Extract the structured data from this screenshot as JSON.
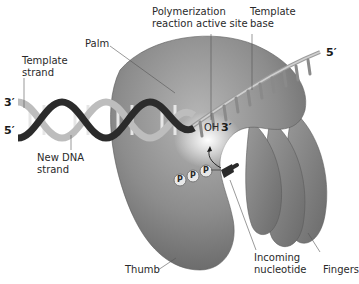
{
  "diagram": {
    "labels": {
      "polymerization_line1": "Polymerization",
      "polymerization_line2": "reaction active site",
      "template_base_line1": "Template",
      "template_base_line2": "base",
      "palm": "Palm",
      "template_strand_line1": "Template",
      "template_strand_line2": "strand",
      "new_dna_line1": "New DNA",
      "new_dna_line2": "strand",
      "thumb": "Thumb",
      "incoming_line1": "Incoming",
      "incoming_line2": "nucleotide",
      "fingers": "Fingers",
      "oh": "OH",
      "oh_end": "3′"
    },
    "strand_ends": {
      "left_top": "3′",
      "left_bottom": "5′",
      "right_top": "5′"
    },
    "phosphates": [
      "P",
      "P",
      "P"
    ],
    "colors": {
      "protein": "#8a8a8a",
      "protein_light": "#b8b8b8",
      "protein_dark": "#5e5e5e",
      "helix_dark": "#2b2b2b",
      "helix_light": "#c9c9c9",
      "leader": "#555555",
      "background": "#ffffff"
    }
  }
}
